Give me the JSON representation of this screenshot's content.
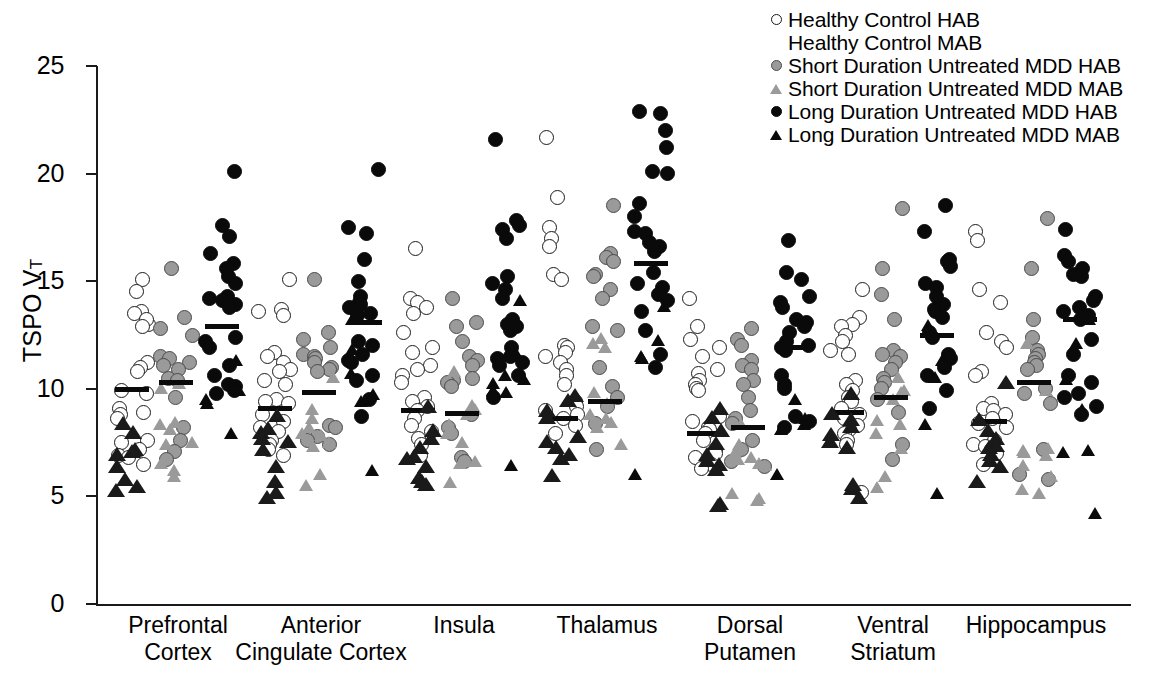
{
  "chart_data": {
    "type": "scatter",
    "title": "",
    "xlabel": "",
    "ylabel": "TSPO VT",
    "ylabel_base": "TSPO V",
    "ylabel_sub": "T",
    "ylim": [
      0,
      25
    ],
    "yticks": [
      25,
      20,
      15,
      10,
      5,
      0
    ],
    "grid": false,
    "legend_position": "top-right",
    "categories": [
      "Prefrontal Cortex",
      "Anterior Cingulate Cortex",
      "Insula",
      "Thalamus",
      "Dorsal Putamen",
      "Ventral Striatum",
      "Hippocampus"
    ],
    "category_lines": [
      [
        "Prefrontal",
        "Cortex"
      ],
      [
        "Anterior",
        "Cingulate Cortex"
      ],
      [
        "Insula",
        ""
      ],
      [
        "Thalamus",
        ""
      ],
      [
        "Dorsal",
        "Putamen"
      ],
      [
        "Ventral",
        "Striatum"
      ],
      [
        "Hippocampus",
        ""
      ]
    ],
    "series": [
      {
        "name": "Healthy Control HAB",
        "marker": "circle",
        "fill": "open",
        "color": "#ffffff",
        "edge": "#1a1a1a"
      },
      {
        "name": "Healthy Control MAB",
        "marker": "triangle",
        "fill": "open",
        "color": "#ffffff",
        "edge": "#1a1a1a"
      },
      {
        "name": "Short Duration Untreated MDD HAB",
        "marker": "circle",
        "fill": "gray",
        "color": "#9a9a9a",
        "edge": "#4a4a4a"
      },
      {
        "name": "Short Duration Untreated MDD MAB",
        "marker": "triangle",
        "fill": "gray",
        "color": "#9a9a9a",
        "edge": "#4a4a4a"
      },
      {
        "name": "Long Duration Untreated MDD HAB",
        "marker": "circle",
        "fill": "black",
        "color": "#0a0a0a",
        "edge": "#0a0a0a"
      },
      {
        "name": "Long Duration Untreated MDD MAB",
        "marker": "triangle",
        "fill": "black",
        "color": "#0a0a0a",
        "edge": "#0a0a0a"
      }
    ],
    "groups": [
      {
        "category": "Prefrontal Cortex",
        "columns": [
          {
            "group_label": "Healthy Control",
            "mean": 9.95,
            "hab": [
              15.1,
              14.5,
              13.6,
              13.5,
              13.0,
              13.2,
              12.9,
              11.2,
              11.0,
              10.8,
              9.9,
              9.8,
              9.1,
              8.9,
              8.8,
              8.6,
              7.6,
              7.5,
              7.2,
              6.9,
              6.8,
              6.5
            ],
            "mab": [
              8.3,
              7.9,
              7.1,
              7.0,
              6.9,
              6.3,
              5.7,
              5.4,
              5.2
            ]
          },
          {
            "group_label": "Short Duration Untreated MDD",
            "mean": 10.3,
            "hab": [
              15.6,
              13.3,
              12.8,
              12.5,
              11.5,
              11.4,
              11.2,
              11.1,
              10.9,
              10.5,
              10.4,
              9.6,
              8.2,
              7.6,
              7.1,
              6.7
            ],
            "mab": [
              10.2,
              10.0,
              8.4,
              8.3,
              8.1,
              7.5,
              7.4,
              6.5,
              6.2,
              5.9
            ]
          },
          {
            "group_label": "Long Duration Untreated MDD",
            "mean": 12.9,
            "hab": [
              20.1,
              17.6,
              17.1,
              16.3,
              15.8,
              15.6,
              15.2,
              14.9,
              14.3,
              14.2,
              14.1,
              13.9,
              13.8,
              12.4,
              12.2,
              11.9,
              11.1,
              10.6,
              10.2,
              10.1,
              9.9,
              9.8
            ],
            "mab": [
              11.3,
              10.0,
              9.9,
              9.5,
              9.3,
              7.9
            ]
          }
        ]
      },
      {
        "category": "Anterior Cingulate Cortex",
        "columns": [
          {
            "group_label": "Healthy Control",
            "mean": 9.1,
            "hab": [
              15.1,
              13.7,
              13.6,
              13.4,
              11.7,
              11.5,
              11.2,
              10.9,
              10.8,
              10.4,
              10.2,
              9.5,
              9.4,
              9.3,
              8.8,
              8.5,
              8.2,
              8.0,
              7.6,
              7.4,
              7.2,
              6.9
            ],
            "mab": [
              8.7,
              8.1,
              7.9,
              7.6,
              7.5,
              7.1,
              6.3,
              5.6,
              5.1,
              4.9
            ]
          },
          {
            "group_label": "Short Duration Untreated MDD",
            "mean": 9.85,
            "hab": [
              15.1,
              12.6,
              12.3,
              11.9,
              11.6,
              11.5,
              11.4,
              11.2,
              11.0,
              10.9,
              10.8,
              8.3,
              8.2,
              7.8,
              7.6,
              7.4
            ],
            "mab": [
              10.5,
              9.0,
              8.6,
              8.2,
              7.9,
              7.8,
              7.5,
              7.3,
              6.0,
              5.5
            ]
          },
          {
            "group_label": "Long Duration Untreated MDD",
            "mean": 13.1,
            "hab": [
              20.2,
              17.5,
              17.2,
              16.0,
              15.0,
              14.3,
              14.0,
              13.9,
              13.8,
              13.5,
              13.4,
              12.2,
              12.0,
              11.6,
              11.3,
              11.2,
              10.6,
              10.4,
              9.5,
              8.7
            ],
            "mab": [
              13.2,
              11.8,
              10.7,
              9.7,
              9.4,
              6.2
            ]
          }
        ]
      },
      {
        "category": "Insula",
        "columns": [
          {
            "group_label": "Healthy Control",
            "mean": 9.0,
            "hab": [
              16.5,
              14.2,
              14.0,
              13.8,
              13.5,
              12.6,
              11.9,
              11.7,
              11.1,
              10.9,
              10.6,
              10.3,
              9.6,
              9.4,
              9.2,
              9.0,
              8.6,
              8.3,
              8.0,
              7.7,
              7.4,
              6.9
            ],
            "mab": [
              9.1,
              8.0,
              7.6,
              7.2,
              6.8,
              6.7,
              6.3,
              5.8,
              5.6,
              5.5
            ]
          },
          {
            "group_label": "Short Duration Untreated MDD",
            "mean": 8.85,
            "hab": [
              14.2,
              13.1,
              12.9,
              12.2,
              11.5,
              11.3,
              11.1,
              10.5,
              10.4,
              10.3,
              10.1,
              8.8,
              8.2,
              7.9,
              6.8,
              6.6
            ],
            "mab": [
              10.8,
              9.2,
              9.0,
              8.8,
              8.3,
              7.9,
              7.5,
              6.6,
              6.5,
              5.6
            ]
          },
          {
            "group_label": "Long Duration Untreated MDD",
            "mean": 11.4,
            "hab": [
              21.6,
              17.8,
              17.6,
              17.4,
              17.0,
              15.2,
              14.9,
              14.6,
              14.2,
              13.2,
              13.0,
              12.9,
              12.7,
              11.9,
              11.5,
              11.4,
              11.2,
              11.1,
              10.6,
              9.6
            ],
            "mab": [
              14.1,
              11.6,
              10.6,
              10.4,
              10.2,
              9.9,
              9.8,
              6.4
            ]
          }
        ]
      },
      {
        "category": "Thalamus",
        "columns": [
          {
            "group_label": "Healthy Control",
            "mean": 8.6,
            "hab": [
              21.7,
              18.9,
              17.5,
              17.0,
              16.6,
              15.3,
              15.1,
              12.0,
              11.9,
              11.7,
              11.5,
              11.2,
              10.9,
              10.6,
              10.2,
              9.4,
              9.2,
              9.0,
              8.8,
              8.6,
              8.3,
              7.9
            ],
            "mab": [
              9.6,
              9.4,
              8.9,
              8.6,
              7.7,
              7.5,
              7.2,
              6.9,
              6.7,
              5.9
            ]
          },
          {
            "group_label": "Short Duration Untreated MDD",
            "mean": 9.4,
            "hab": [
              18.5,
              16.3,
              16.1,
              15.9,
              15.3,
              15.2,
              14.6,
              14.2,
              12.9,
              12.7,
              11.0,
              10.1,
              9.6,
              9.2,
              8.4,
              7.2
            ],
            "mab": [
              12.3,
              12.1,
              11.9,
              9.8,
              9.3,
              8.8,
              8.6,
              8.4,
              8.2,
              7.4
            ]
          },
          {
            "group_label": "Long Duration Untreated MDD",
            "mean": 15.8,
            "hab": [
              22.9,
              22.8,
              22.0,
              21.2,
              20.1,
              20.0,
              18.6,
              18.0,
              17.3,
              17.2,
              16.8,
              16.6,
              16.4,
              15.4,
              14.9,
              14.7,
              14.4,
              14.1,
              13.6,
              12.7,
              11.6,
              11.0
            ],
            "mab": [
              13.8,
              12.2,
              11.5,
              11.4,
              6.0
            ]
          }
        ]
      },
      {
        "category": "Dorsal Putamen",
        "columns": [
          {
            "group_label": "Healthy Control",
            "mean": 7.9,
            "hab": [
              14.2,
              12.9,
              12.3,
              11.9,
              11.5,
              10.9,
              10.7,
              10.4,
              10.2,
              10.0,
              9.9,
              8.7,
              8.5,
              8.2,
              8.1,
              7.9,
              7.6,
              7.2,
              7.0,
              6.8,
              6.5,
              6.3
            ],
            "mab": [
              9.0,
              8.6,
              8.0,
              7.4,
              6.9,
              6.6,
              6.4,
              6.2,
              4.6,
              4.5
            ]
          },
          {
            "group_label": "Short Duration Untreated MDD",
            "mean": 8.2,
            "hab": [
              12.8,
              12.3,
              12.0,
              11.3,
              11.1,
              10.9,
              10.4,
              10.2,
              9.6,
              9.0,
              8.6,
              8.4,
              7.6,
              7.2,
              6.6,
              6.4
            ],
            "mab": [
              8.3,
              7.4,
              7.0,
              6.8,
              6.7,
              6.5,
              6.4,
              5.1,
              4.9,
              4.8
            ]
          },
          {
            "group_label": "Long Duration Untreated MDD",
            "mean": 11.9,
            "hab": [
              16.9,
              15.4,
              15.1,
              14.3,
              14.0,
              13.8,
              13.2,
              13.1,
              12.9,
              12.6,
              12.2,
              12.0,
              11.9,
              11.8,
              10.6,
              10.2,
              10.0,
              8.7,
              8.5,
              8.2
            ],
            "mab": [
              9.5,
              8.6,
              8.3,
              8.1,
              6.0
            ]
          }
        ]
      },
      {
        "category": "Ventral Striatum",
        "columns": [
          {
            "group_label": "Healthy Control",
            "mean": 8.9,
            "hab": [
              14.6,
              13.3,
              13.0,
              12.9,
              12.5,
              12.2,
              11.8,
              11.6,
              10.4,
              10.2,
              9.9,
              9.6,
              9.4,
              9.1,
              8.8,
              8.6,
              8.3,
              8.1,
              7.9,
              7.6,
              7.4,
              5.2
            ],
            "mab": [
              9.7,
              8.8,
              8.5,
              8.2,
              7.8,
              7.5,
              7.2,
              5.5,
              5.3,
              4.9
            ]
          },
          {
            "group_label": "Short Duration Untreated MDD",
            "mean": 9.6,
            "hab": [
              18.4,
              15.6,
              14.4,
              13.2,
              11.8,
              11.6,
              11.5,
              11.2,
              10.9,
              10.5,
              10.3,
              10.0,
              9.5,
              8.9,
              7.4,
              6.7
            ],
            "mab": [
              10.5,
              9.9,
              9.8,
              9.5,
              8.5,
              8.3,
              7.9,
              7.2,
              5.9,
              5.4
            ]
          },
          {
            "group_label": "Long Duration Untreated MDD",
            "mean": 12.5,
            "hab": [
              18.5,
              17.3,
              16.0,
              15.9,
              15.7,
              14.9,
              14.7,
              14.3,
              13.9,
              13.7,
              13.6,
              13.3,
              12.6,
              12.4,
              11.6,
              11.4,
              11.0,
              10.6,
              9.9,
              9.1
            ],
            "mab": [
              12.9,
              11.3,
              10.5,
              8.3,
              5.1
            ]
          }
        ]
      },
      {
        "category": "Hippocampus",
        "columns": [
          {
            "group_label": "Healthy Control",
            "mean": 8.5,
            "hab": [
              17.3,
              16.9,
              14.6,
              14.0,
              12.6,
              12.2,
              11.9,
              10.8,
              10.6,
              9.3,
              9.1,
              9.0,
              8.8,
              8.6,
              8.4,
              8.2,
              7.6,
              7.4,
              7.3,
              7.2,
              7.0,
              6.5
            ],
            "mab": [
              10.2,
              8.5,
              8.0,
              7.6,
              7.3,
              7.2,
              6.9,
              6.6,
              6.3,
              5.6
            ]
          },
          {
            "group_label": "Short Duration Untreated MDD",
            "mean": 10.3,
            "hab": [
              17.9,
              15.6,
              13.2,
              12.4,
              11.8,
              11.6,
              11.4,
              11.2,
              11.1,
              10.9,
              10.0,
              9.8,
              9.3,
              7.2,
              6.0,
              5.8
            ],
            "mab": [
              12.1,
              9.9,
              7.2,
              7.1,
              7.0,
              6.9,
              6.4,
              5.9,
              5.3,
              5.1
            ]
          },
          {
            "group_label": "Long Duration Untreated MDD",
            "mean": 13.2,
            "hab": [
              17.4,
              16.2,
              15.9,
              15.6,
              15.3,
              15.2,
              14.3,
              14.1,
              13.8,
              13.6,
              13.4,
              13.2,
              12.3,
              11.6,
              10.6,
              10.3,
              9.8,
              9.6,
              9.2,
              8.8
            ],
            "mab": [
              13.2,
              12.1,
              10.4,
              9.0,
              7.1,
              7.0,
              4.2
            ]
          }
        ]
      }
    ]
  },
  "legend": {
    "items": [
      {
        "label": "Healthy Control HAB",
        "marker_name": "open-circle-marker",
        "marker_class": "circle open-circle"
      },
      {
        "label": "Healthy Control MAB",
        "marker_name": "open-triangle-marker",
        "marker_class": "tri open-tri"
      },
      {
        "label": "Short Duration Untreated MDD HAB",
        "marker_name": "gray-circle-marker",
        "marker_class": "circle gray-circle"
      },
      {
        "label": "Short Duration Untreated MDD MAB",
        "marker_name": "gray-triangle-marker",
        "marker_class": "tri gray-tri"
      },
      {
        "label": "Long Duration Untreated MDD HAB",
        "marker_name": "black-circle-marker",
        "marker_class": "circle black-circle"
      },
      {
        "label": "Long Duration Untreated MDD MAB",
        "marker_name": "black-triangle-marker",
        "marker_class": "tri black-tri"
      }
    ]
  }
}
